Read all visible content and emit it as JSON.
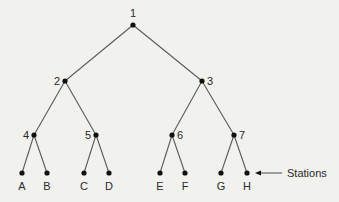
{
  "diagram": {
    "type": "binary-tree",
    "background": "#f1f1ee",
    "line_color": "#5a5a5a",
    "node_color": "#111111",
    "nodes": [
      {
        "id": "1",
        "label": "1",
        "x": 133,
        "y": 25,
        "label_pos": "top"
      },
      {
        "id": "2",
        "label": "2",
        "x": 65,
        "y": 81,
        "label_pos": "left"
      },
      {
        "id": "3",
        "label": "3",
        "x": 202,
        "y": 81,
        "label_pos": "right"
      },
      {
        "id": "4",
        "label": "4",
        "x": 34,
        "y": 135,
        "label_pos": "left"
      },
      {
        "id": "5",
        "label": "5",
        "x": 96,
        "y": 135,
        "label_pos": "left"
      },
      {
        "id": "6",
        "label": "6",
        "x": 172,
        "y": 135,
        "label_pos": "right"
      },
      {
        "id": "7",
        "label": "7",
        "x": 234,
        "y": 135,
        "label_pos": "right"
      },
      {
        "id": "A",
        "label": "A",
        "x": 22,
        "y": 173,
        "label_pos": "bottom"
      },
      {
        "id": "B",
        "label": "B",
        "x": 47,
        "y": 173,
        "label_pos": "bottom"
      },
      {
        "id": "C",
        "label": "C",
        "x": 84,
        "y": 173,
        "label_pos": "bottom"
      },
      {
        "id": "D",
        "label": "D",
        "x": 109,
        "y": 173,
        "label_pos": "bottom"
      },
      {
        "id": "E",
        "label": "E",
        "x": 160,
        "y": 173,
        "label_pos": "bottom"
      },
      {
        "id": "F",
        "label": "F",
        "x": 185,
        "y": 173,
        "label_pos": "bottom"
      },
      {
        "id": "G",
        "label": "G",
        "x": 221,
        "y": 173,
        "label_pos": "bottom"
      },
      {
        "id": "H",
        "label": "H",
        "x": 247,
        "y": 173,
        "label_pos": "bottom"
      }
    ],
    "edges": [
      [
        "1",
        "2"
      ],
      [
        "1",
        "3"
      ],
      [
        "2",
        "4"
      ],
      [
        "2",
        "5"
      ],
      [
        "3",
        "6"
      ],
      [
        "3",
        "7"
      ],
      [
        "4",
        "A"
      ],
      [
        "4",
        "B"
      ],
      [
        "5",
        "C"
      ],
      [
        "5",
        "D"
      ],
      [
        "6",
        "E"
      ],
      [
        "6",
        "F"
      ],
      [
        "7",
        "G"
      ],
      [
        "7",
        "H"
      ]
    ],
    "annotation": {
      "text": "Stations",
      "points_to": "H",
      "arrow_from_x": 282,
      "arrow_to_x": 255,
      "y": 173,
      "text_x": 287
    }
  }
}
